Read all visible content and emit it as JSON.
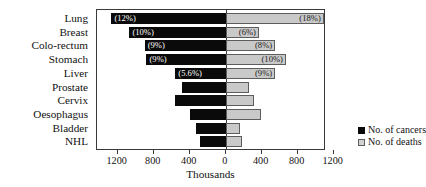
{
  "chart_data": {
    "type": "bar",
    "orientation": "horizontal-diverging",
    "title": "",
    "xlabel": "Thousands",
    "ylabel": "",
    "categories": [
      "Lung",
      "Breast",
      "Colo-rectum",
      "Stomach",
      "Liver",
      "Prostate",
      "Cervix",
      "Oesophagus",
      "Bladder",
      "NHL"
    ],
    "series": [
      {
        "name": "No. of cancers",
        "direction": "left",
        "color": "#0a0a0a",
        "values": [
          1270,
          1070,
          900,
          880,
          560,
          480,
          560,
          400,
          330,
          290
        ],
        "labels": [
          "(12%)",
          "(10%)",
          "(9%)",
          "(9%)",
          "(5.6%)",
          "",
          "",
          "",
          "",
          ""
        ]
      },
      {
        "name": "No. of deaths",
        "direction": "right",
        "color": "#c9c9c9",
        "values": [
          1090,
          370,
          550,
          670,
          550,
          255,
          310,
          390,
          160,
          180
        ],
        "labels": [
          "(18%)",
          "(6%)",
          "(8%)",
          "(10%)",
          "(9%)",
          "",
          "",
          "",
          "",
          ""
        ]
      }
    ],
    "xticks": [
      -1200,
      -800,
      -400,
      0,
      400,
      800,
      1200
    ],
    "xtick_labels": [
      "1200",
      "800",
      "400",
      "0",
      "400",
      "800",
      "1200"
    ],
    "xlim": [
      -1430,
      1115
    ],
    "grid": false,
    "legend_position": "bottom-right"
  },
  "legend": {
    "items": [
      {
        "label": "No. of cancers",
        "swatch": "cancers"
      },
      {
        "label": "No. of deaths",
        "swatch": "deaths"
      }
    ]
  }
}
